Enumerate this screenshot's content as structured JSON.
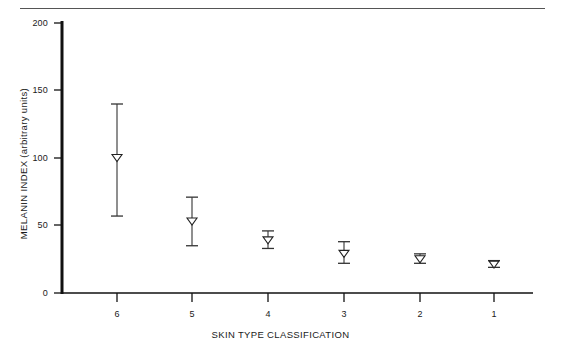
{
  "figure": {
    "width": 561,
    "height": 352,
    "background": "#ffffff",
    "ink_color": "#1a1a1a",
    "rule_color": "#555555",
    "has_top_rule": true
  },
  "chart_data": {
    "type": "scatter",
    "title": "",
    "subtitle": "",
    "xlabel": "SKIN TYPE CLASSIFICATION",
    "ylabel": "MELANIN INDEX (arbitrary units)",
    "categories": [
      "6",
      "5",
      "4",
      "3",
      "2",
      "1"
    ],
    "values": [
      100,
      53,
      39,
      29,
      25,
      21
    ],
    "error_low": [
      57,
      35,
      33,
      22,
      22,
      19
    ],
    "error_high": [
      140,
      71,
      46,
      38,
      29,
      24
    ],
    "error_type": "range-bars",
    "marker": "open-down-triangle",
    "ylim": [
      0,
      200
    ],
    "yticks": [
      0,
      50,
      100,
      150,
      200
    ],
    "ytick_labels": [
      "0",
      "50",
      "100",
      "150",
      "200"
    ],
    "xtick_labels": [
      "6",
      "5",
      "4",
      "3",
      "2",
      "1"
    ],
    "grid": false,
    "legend": null,
    "series": [
      {
        "name": "Melanin index by skin type",
        "points": [
          {
            "category": "6",
            "value": 100,
            "low": 57,
            "high": 140
          },
          {
            "category": "5",
            "value": 53,
            "low": 35,
            "high": 71
          },
          {
            "category": "4",
            "value": 39,
            "low": 33,
            "high": 46
          },
          {
            "category": "3",
            "value": 29,
            "low": 22,
            "high": 38
          },
          {
            "category": "2",
            "value": 25,
            "low": 22,
            "high": 29
          },
          {
            "category": "1",
            "value": 21,
            "low": 19,
            "high": 24
          }
        ]
      }
    ]
  },
  "layout": {
    "plot_left_px": 62,
    "plot_right_px": 533,
    "y_zero_px": 293,
    "y_top_px": 23,
    "tick_x_px": [
      117,
      192,
      268,
      344,
      420,
      494
    ]
  }
}
